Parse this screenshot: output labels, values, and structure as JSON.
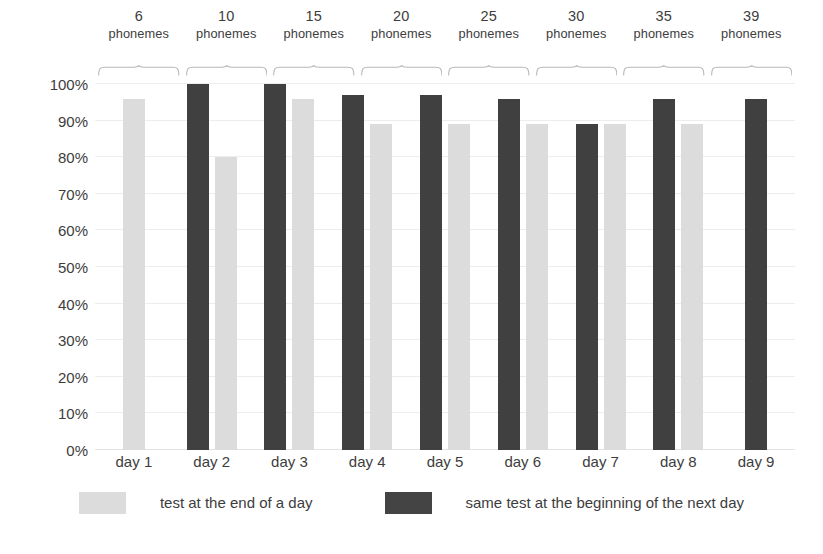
{
  "chart_data": {
    "type": "bar",
    "title": "",
    "subtitle": "",
    "xlabel": "",
    "ylabel": "",
    "ylim": [
      0,
      100
    ],
    "yticks": [
      "0%",
      "10%",
      "20%",
      "30%",
      "40%",
      "50%",
      "60%",
      "70%",
      "80%",
      "90%",
      "100%"
    ],
    "ytick_values": [
      0,
      10,
      20,
      30,
      40,
      50,
      60,
      70,
      80,
      90,
      100
    ],
    "grid": true,
    "legend_position": "bottom",
    "categories": [
      "day 1",
      "day 2",
      "day 3",
      "day 4",
      "day 5",
      "day 6",
      "day 7",
      "day 8",
      "day 9"
    ],
    "series": [
      {
        "name": "test at the end of a day",
        "color": "#dcdcdc",
        "values": [
          96,
          80,
          96,
          89,
          89,
          89,
          89,
          89,
          null
        ]
      },
      {
        "name": "same test at the beginning of the next day",
        "color": "#404040",
        "values": [
          null,
          100,
          100,
          97,
          97,
          96,
          89,
          96,
          96
        ]
      }
    ],
    "group_brackets": [
      {
        "count": "6",
        "unit": "phonemes"
      },
      {
        "count": "10",
        "unit": "phonemes"
      },
      {
        "count": "15",
        "unit": "phonemes"
      },
      {
        "count": "20",
        "unit": "phonemes"
      },
      {
        "count": "25",
        "unit": "phonemes"
      },
      {
        "count": "30",
        "unit": "phonemes"
      },
      {
        "count": "35",
        "unit": "phonemes"
      },
      {
        "count": "39",
        "unit": "phonemes"
      }
    ]
  },
  "legend": {
    "light_label": "test at the end of a day",
    "dark_label": "same test at the beginning of the next day"
  },
  "colors": {
    "light_bar": "#dcdcdc",
    "dark_bar": "#404040",
    "gridline": "#ededed",
    "text": "#3d3d3d"
  },
  "caption": ""
}
